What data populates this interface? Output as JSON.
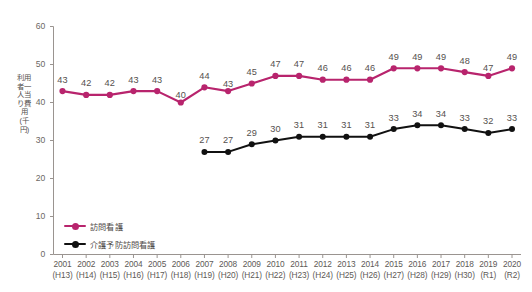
{
  "chart_data": {
    "type": "line",
    "title": "",
    "xlabel": "",
    "ylabel": "利用者一人当り費用(千円)",
    "ylim": [
      0,
      60
    ],
    "yticks": [
      0,
      10,
      20,
      30,
      40,
      50,
      60
    ],
    "grid": false,
    "legend_position": "bottom-left",
    "categories": [
      "2001",
      "2002",
      "2003",
      "2004",
      "2005",
      "2006",
      "2007",
      "2008",
      "2009",
      "2010",
      "2011",
      "2012",
      "2013",
      "2014",
      "2015",
      "2016",
      "2017",
      "2018",
      "2019",
      "2020"
    ],
    "category_sublabels": [
      "(H13)",
      "(H14)",
      "(H15)",
      "(H16)",
      "(H17)",
      "(H18)",
      "(H19)",
      "(H20)",
      "(H21)",
      "(H22)",
      "(H23)",
      "(H24)",
      "(H25)",
      "(H26)",
      "(H27)",
      "(H28)",
      "(H29)",
      "(H30)",
      "(R1)",
      "(R2)"
    ],
    "series": [
      {
        "name": "訪問看護",
        "color": "#b8246d",
        "values": [
          43,
          42,
          42,
          43,
          43,
          40,
          44,
          43,
          45,
          47,
          47,
          46,
          46,
          46,
          49,
          49,
          49,
          48,
          47,
          49
        ]
      },
      {
        "name": "介護予防訪問看護",
        "color": "#111111",
        "values": [
          null,
          null,
          null,
          null,
          null,
          null,
          27,
          27,
          29,
          30,
          31,
          31,
          31,
          31,
          33,
          34,
          34,
          33,
          32,
          33
        ]
      }
    ]
  },
  "footer": {
    "caption": ""
  },
  "colors": {
    "pink": "#b8246d",
    "black": "#111111",
    "axis": "#9a9490",
    "text": "#55504e"
  }
}
